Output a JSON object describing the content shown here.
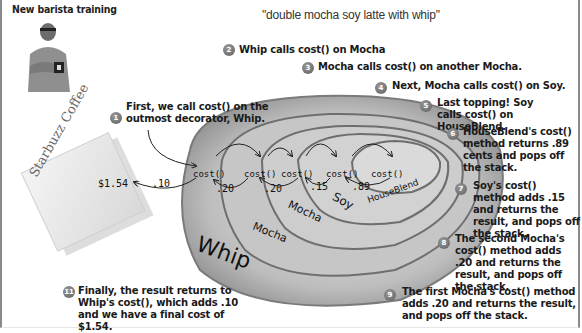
{
  "header": {
    "section_title": "New barista training",
    "order": "\"double mocha soy latte with whip\""
  },
  "napkin": {
    "brand": "Starbuzz Coffee",
    "total": "$1.54"
  },
  "layers": [
    {
      "name": "Whip",
      "method": "cost()",
      "returns": ".10"
    },
    {
      "name": "Mocha",
      "method": "cost()",
      "returns": ".20"
    },
    {
      "name": "Mocha",
      "method": "cost()",
      "returns": ".20"
    },
    {
      "name": "Soy",
      "method": "cost()",
      "returns": ".15"
    },
    {
      "name": "HouseBlend",
      "method": "cost()",
      "returns": ".89"
    }
  ],
  "steps": [
    {
      "num": "1",
      "text": "First, we call cost() on the outmost decorator, Whip."
    },
    {
      "num": "2",
      "text": "Whip calls cost() on Mocha"
    },
    {
      "num": "3",
      "text": "Mocha calls cost() on another Mocha."
    },
    {
      "num": "4",
      "text": "Next, Mocha calls cost() on Soy."
    },
    {
      "num": "5",
      "text": "Last topping! Soy calls cost() on HouseBlend."
    },
    {
      "num": "6",
      "text": "HouseBlend's cost() method returns .89 cents and pops off the stack."
    },
    {
      "num": "7",
      "text": "Soy's cost() method adds .15 and returns the result, and pops off the stack."
    },
    {
      "num": "8",
      "text": "The second Mocha's cost() method adds .20 and returns the result, and pops off the stack."
    },
    {
      "num": "9",
      "text": "The first Mocha's cost() method adds .20 and returns the result, and pops off the stack."
    },
    {
      "num": "11",
      "text": "Finally, the result returns to Whip's cost(), which adds .10 and we have a final cost of $1.54."
    }
  ],
  "colors": {
    "step_badge": "#6e6e6e",
    "ring_dark": "#7a7a7a",
    "ring_light": "#cfcfcf",
    "text": "#1a1a1a"
  }
}
